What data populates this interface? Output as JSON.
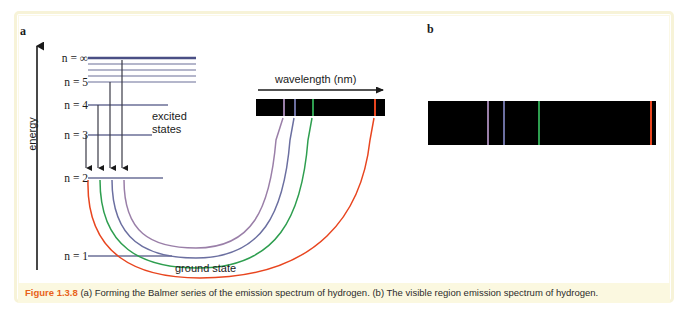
{
  "figure": {
    "caption_prefix": "Figure 1.3.8",
    "caption_body": " (a) Forming the Balmer series of the emission spectrum of hydrogen. (b) The visible region emission spectrum of hydrogen.",
    "panel_a_label": "a",
    "panel_b_label": "b"
  },
  "panel_a": {
    "y_axis_label": "energy",
    "excited_states_label": "excited\nstates",
    "ground_state_label": "ground state",
    "wavelength_label": "wavelength (nm)",
    "energy_levels": [
      {
        "label": "n = ∞",
        "n": "infinity",
        "y": 58
      },
      {
        "label": "n = 5",
        "n": "5",
        "y": 82
      },
      {
        "label": "n = 4",
        "n": "4",
        "y": 105
      },
      {
        "label": "n = 3",
        "n": "3",
        "y": 135
      },
      {
        "label": "n = 2",
        "n": "2",
        "y": 178
      },
      {
        "label": "n = 1",
        "n": "1",
        "y": 256
      }
    ],
    "transitions": [
      {
        "from": "3",
        "to": "2",
        "color": "#e8451f",
        "name": "red-transition"
      },
      {
        "from": "4",
        "to": "2",
        "color": "#2e9e4f",
        "name": "green-transition"
      },
      {
        "from": "5",
        "to": "2",
        "color": "#6b6fa0",
        "name": "blue-violet-transition"
      },
      {
        "from": "infinity",
        "to": "2",
        "color": "#9a7fa8",
        "name": "violet-transition"
      }
    ],
    "spectrum_lines": [
      {
        "color": "#9a7fa8",
        "x": 283,
        "name": "violet-line"
      },
      {
        "color": "#6b6fa0",
        "x": 294,
        "name": "blue-violet-line"
      },
      {
        "color": "#2e9e4f",
        "x": 312,
        "name": "green-line"
      },
      {
        "color": "#e8451f",
        "x": 374,
        "name": "red-line"
      }
    ]
  },
  "panel_b": {
    "spectrum_lines": [
      {
        "color": "#9a7fa8",
        "x": 487,
        "name": "violet-line"
      },
      {
        "color": "#6b6fa0",
        "x": 503,
        "name": "blue-violet-line"
      },
      {
        "color": "#2e9e4f",
        "x": 538,
        "name": "green-line"
      },
      {
        "color": "#e8451f",
        "x": 650,
        "name": "red-line"
      }
    ]
  },
  "colors": {
    "violet": "#9a7fa8",
    "blue_violet": "#6b6fa0",
    "green": "#2e9e4f",
    "red": "#e8451f",
    "level_line": "#6b6f97",
    "accent": "#e8621a",
    "caption_bg": "#fbf8e0",
    "frame": "#f7f3d8"
  }
}
